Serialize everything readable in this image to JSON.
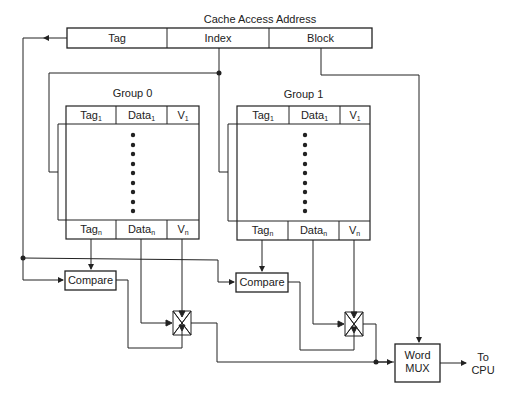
{
  "diagram": {
    "title": "Cache Access Address",
    "address_fields": [
      "Tag",
      "Index",
      "Block"
    ],
    "groups": [
      {
        "label": "Group 0",
        "top_row": {
          "tag": "Tag",
          "tag_sub": "1",
          "data": "Data",
          "data_sub": "1",
          "valid": "V",
          "valid_sub": "1"
        },
        "bottom_row": {
          "tag": "Tag",
          "tag_sub": "n",
          "data": "Data",
          "data_sub": "n",
          "valid": "V",
          "valid_sub": "n"
        },
        "compare_label": "Compare"
      },
      {
        "label": "Group 1",
        "top_row": {
          "tag": "Tag",
          "tag_sub": "1",
          "data": "Data",
          "data_sub": "1",
          "valid": "V",
          "valid_sub": "1"
        },
        "bottom_row": {
          "tag": "Tag",
          "tag_sub": "n",
          "data": "Data",
          "data_sub": "n",
          "valid": "V",
          "valid_sub": "n"
        },
        "compare_label": "Compare"
      }
    ],
    "mux": {
      "line1": "Word",
      "line2": "MUX"
    },
    "output": {
      "line1": "To",
      "line2": "CPU"
    }
  }
}
